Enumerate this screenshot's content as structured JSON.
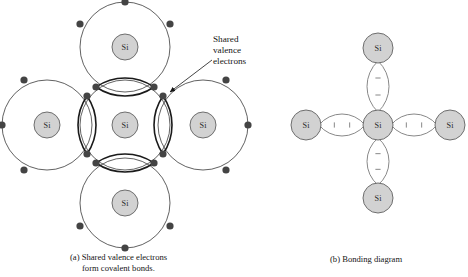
{
  "figure": {
    "atom_label": "Si",
    "annotation": {
      "line1": "Shared",
      "line2": "valence",
      "line3": "electrons"
    },
    "captions": {
      "a_line1": "(a) Shared valence electrons",
      "a_line2": "form covalent bonds.",
      "b_line1": "(b) Bonding diagram"
    }
  },
  "colors": {
    "atom_fill": "#d2d2d2",
    "atom_stroke": "#6e6e6e",
    "orbit_stroke": "#3a3a3a",
    "bond_stroke": "#1a1a1a",
    "electron_fill": "#444444",
    "bond_light_stroke": "#7a7a7a",
    "text": "#151515",
    "background": "#ffffff"
  },
  "panel_a": {
    "name": "covalent-bond-diagram",
    "center": {
      "cx": 125,
      "cy": 125,
      "r_atom": 13,
      "r_orbit": 45
    },
    "neighbors": [
      {
        "name": "top",
        "cx": 125,
        "cy": 47,
        "r_atom": 13,
        "r_orbit": 45
      },
      {
        "name": "left",
        "cx": 47,
        "cy": 125,
        "r_atom": 13,
        "r_orbit": 45
      },
      {
        "name": "right",
        "cx": 203,
        "cy": 125,
        "r_atom": 13,
        "r_orbit": 45
      },
      {
        "name": "bottom",
        "cx": 125,
        "cy": 203,
        "r_atom": 13,
        "r_orbit": 45
      }
    ],
    "electron_radius": 3.6,
    "outer_electrons": [
      {
        "cx": 125,
        "cy": 2
      },
      {
        "cx": 80,
        "cy": 24
      },
      {
        "cx": 170,
        "cy": 24
      },
      {
        "cx": 2,
        "cy": 125
      },
      {
        "cx": 24,
        "cy": 80
      },
      {
        "cx": 24,
        "cy": 170
      },
      {
        "cx": 226,
        "cy": 80
      },
      {
        "cx": 248,
        "cy": 125
      },
      {
        "cx": 226,
        "cy": 170
      },
      {
        "cx": 80,
        "cy": 226
      },
      {
        "cx": 170,
        "cy": 226
      },
      {
        "cx": 125,
        "cy": 248
      }
    ],
    "shared_electrons": [
      {
        "cx": 96,
        "cy": 87
      },
      {
        "cx": 154,
        "cy": 87
      },
      {
        "cx": 87,
        "cy": 96
      },
      {
        "cx": 163,
        "cy": 96
      },
      {
        "cx": 87,
        "cy": 154
      },
      {
        "cx": 163,
        "cy": 154
      },
      {
        "cx": 96,
        "cy": 163
      },
      {
        "cx": 154,
        "cy": 163
      }
    ],
    "bond_lens_count": 4,
    "annotation_arrow": {
      "x1": 212,
      "y1": 60,
      "x2": 170,
      "y2": 92
    }
  },
  "panel_b": {
    "name": "bonding-diagram",
    "center": {
      "cx": 378,
      "cy": 125,
      "r_atom": 15
    },
    "neighbors": [
      {
        "name": "top",
        "cx": 378,
        "cy": 48
      },
      {
        "name": "left",
        "cx": 306,
        "cy": 125
      },
      {
        "name": "right",
        "cx": 450,
        "cy": 125
      },
      {
        "name": "bottom",
        "cx": 378,
        "cy": 198
      }
    ],
    "bond_marks_per_bond": 2
  }
}
